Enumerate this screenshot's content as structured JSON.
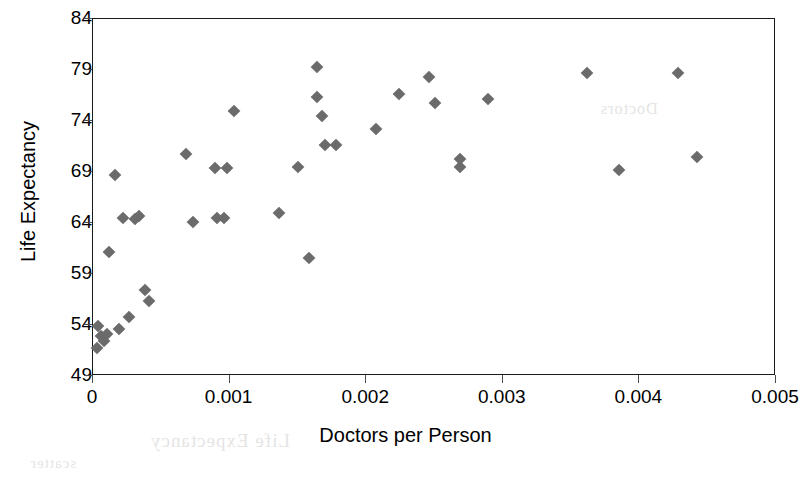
{
  "chart_data": {
    "type": "scatter",
    "title": "",
    "xlabel": "Doctors per Person",
    "ylabel": "Life Expectancy",
    "xlim": [
      0,
      0.005
    ],
    "ylim": [
      49,
      84
    ],
    "xticks": [
      "0",
      "0.001",
      "0.002",
      "0.003",
      "0.004",
      "0.005"
    ],
    "xtick_values": [
      0,
      0.001,
      0.002,
      0.003,
      0.004,
      0.005
    ],
    "yticks": [
      "49",
      "54",
      "59",
      "64",
      "69",
      "74",
      "79",
      "84"
    ],
    "ytick_values": [
      49,
      54,
      59,
      64,
      69,
      74,
      79,
      84
    ],
    "grid": false,
    "legend": false,
    "marker": "diamond",
    "marker_color": "#6b6b6b",
    "axis_color": "#1a1a1a",
    "background": "#ffffff",
    "points": [
      {
        "x": 3e-05,
        "y": 51.7
      },
      {
        "x": 4e-05,
        "y": 53.9
      },
      {
        "x": 6e-05,
        "y": 52.9
      },
      {
        "x": 8e-05,
        "y": 52.4
      },
      {
        "x": 0.0001,
        "y": 53.1
      },
      {
        "x": 0.00012,
        "y": 61.2
      },
      {
        "x": 0.00016,
        "y": 68.7
      },
      {
        "x": 0.00019,
        "y": 53.6
      },
      {
        "x": 0.00022,
        "y": 64.5
      },
      {
        "x": 0.00026,
        "y": 54.8
      },
      {
        "x": 0.00031,
        "y": 64.4
      },
      {
        "x": 0.00034,
        "y": 64.7
      },
      {
        "x": 0.00038,
        "y": 57.4
      },
      {
        "x": 0.00041,
        "y": 56.4
      },
      {
        "x": 0.00068,
        "y": 70.8
      },
      {
        "x": 0.00073,
        "y": 64.1
      },
      {
        "x": 0.00089,
        "y": 69.4
      },
      {
        "x": 0.00091,
        "y": 64.5
      },
      {
        "x": 0.00096,
        "y": 64.5
      },
      {
        "x": 0.00098,
        "y": 69.4
      },
      {
        "x": 0.00103,
        "y": 75.0
      },
      {
        "x": 0.00136,
        "y": 65.0
      },
      {
        "x": 0.0015,
        "y": 69.5
      },
      {
        "x": 0.00158,
        "y": 60.6
      },
      {
        "x": 0.00164,
        "y": 79.3
      },
      {
        "x": 0.00164,
        "y": 76.4
      },
      {
        "x": 0.00168,
        "y": 74.5
      },
      {
        "x": 0.0017,
        "y": 71.6
      },
      {
        "x": 0.00178,
        "y": 71.6
      },
      {
        "x": 0.00207,
        "y": 73.2
      },
      {
        "x": 0.00224,
        "y": 76.6
      },
      {
        "x": 0.00246,
        "y": 78.3
      },
      {
        "x": 0.0025,
        "y": 75.8
      },
      {
        "x": 0.00269,
        "y": 70.3
      },
      {
        "x": 0.00269,
        "y": 69.5
      },
      {
        "x": 0.00289,
        "y": 76.2
      },
      {
        "x": 0.00362,
        "y": 78.7
      },
      {
        "x": 0.00385,
        "y": 69.2
      },
      {
        "x": 0.00428,
        "y": 78.7
      },
      {
        "x": 0.00442,
        "y": 70.5
      }
    ]
  },
  "bleed_text": {
    "line1": "Life Expectancy",
    "line2": "Doctors",
    "line3": "scatter"
  }
}
